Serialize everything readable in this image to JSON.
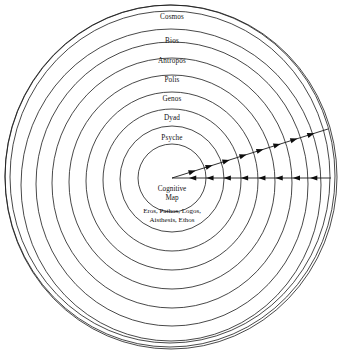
{
  "diagram": {
    "background_color": "#ffffff",
    "stroke_color": "#1a1a1a",
    "center": {
      "cx": 172,
      "cy": 178
    },
    "ring_count": 11,
    "rings": [
      {
        "name": "ring-1-innermost",
        "rx": 34,
        "ry": 34,
        "cx": 172,
        "cy": 178
      },
      {
        "name": "ring-2",
        "rx": 52,
        "ry": 53,
        "cx": 172,
        "cy": 179
      },
      {
        "name": "ring-3",
        "rx": 69,
        "ry": 71,
        "cx": 172,
        "cy": 180
      },
      {
        "name": "ring-4",
        "rx": 86,
        "ry": 89,
        "cx": 172,
        "cy": 181
      },
      {
        "name": "ring-5",
        "rx": 103,
        "ry": 107,
        "cx": 172,
        "cy": 182
      },
      {
        "name": "ring-6",
        "rx": 120,
        "ry": 125,
        "cx": 172,
        "cy": 183
      },
      {
        "name": "ring-7",
        "rx": 136,
        "ry": 142,
        "cx": 172,
        "cy": 184
      },
      {
        "name": "ring-8",
        "rx": 150,
        "ry": 156,
        "cx": 171,
        "cy": 185
      },
      {
        "name": "ring-9",
        "rx": 160,
        "ry": 166,
        "cx": 170,
        "cy": 177
      },
      {
        "name": "ring-10",
        "rx": 165,
        "ry": 171,
        "cx": 170,
        "cy": 176
      },
      {
        "name": "ring-11-outermost",
        "rx": 166,
        "ry": 172,
        "cx": 171,
        "cy": 177
      }
    ],
    "ring_labels": [
      {
        "id": "cosmos",
        "text": "Cosmos",
        "x": 172,
        "y": 17
      },
      {
        "id": "bios",
        "text": "Bios",
        "x": 172,
        "y": 41
      },
      {
        "id": "antropos",
        "text": "Antropos",
        "x": 172,
        "y": 61
      },
      {
        "id": "polis",
        "text": "Polis",
        "x": 172,
        "y": 80
      },
      {
        "id": "genos",
        "text": "Genos",
        "x": 172,
        "y": 99
      },
      {
        "id": "dyad",
        "text": "Dyad",
        "x": 172,
        "y": 118
      },
      {
        "id": "psyche",
        "text": "Psyche",
        "x": 172,
        "y": 138
      }
    ],
    "center_label": {
      "line1": "Cognitive",
      "line2": "Map",
      "x": 172,
      "y": 194
    },
    "center_sublabel": {
      "line1": "Eros, Pathos, Logos,",
      "line2": "Aisthesis, Ethos",
      "x": 172,
      "y": 216
    },
    "rays": [
      {
        "id": "outward-ray",
        "direction": "outward",
        "description": "diagonal ray from center to upper-right with arrowheads pointing away from center",
        "x1": 172,
        "y1": 178,
        "x2": 328,
        "y2": 129,
        "arrowhead_count": 8
      },
      {
        "id": "inward-ray",
        "direction": "inward",
        "description": "horizontal ray from right edge to center with arrowheads pointing toward center",
        "x1": 172,
        "y1": 178,
        "x2": 331,
        "y2": 178,
        "arrowhead_count": 8
      }
    ]
  }
}
